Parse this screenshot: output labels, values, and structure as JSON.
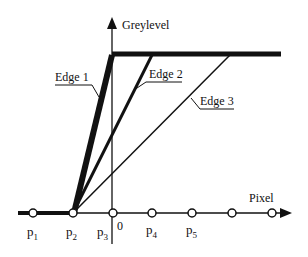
{
  "diagram": {
    "y_axis_label": "Greylevel",
    "x_axis_label": "Pixel",
    "origin_label": "0",
    "edges": [
      {
        "label": "Edge 1",
        "style": "thick"
      },
      {
        "label": "Edge 2",
        "style": "medium"
      },
      {
        "label": "Edge 3",
        "style": "thin"
      }
    ],
    "pixels": [
      {
        "base": "p",
        "sub": "1"
      },
      {
        "base": "p",
        "sub": "2"
      },
      {
        "base": "p",
        "sub": "3"
      },
      {
        "base": "p",
        "sub": "4"
      },
      {
        "base": "p",
        "sub": "5"
      }
    ],
    "colors": {
      "line": "#111111",
      "background": "#ffffff"
    }
  }
}
